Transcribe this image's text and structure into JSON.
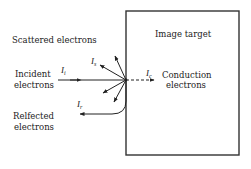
{
  "diagram": {
    "type": "electron-interaction",
    "target_label": "Image target",
    "labels": {
      "scattered": "Scattered electrons",
      "incident_line1": "Incident",
      "incident_line2": "electrons",
      "reflected_line1": "Relfected",
      "reflected_line2": "electrons",
      "conduction_line1": "Conduction",
      "conduction_line2": "electrons"
    },
    "symbols": {
      "incident": {
        "main": "I",
        "sub": "i"
      },
      "scattered": {
        "main": "I",
        "sub": "s"
      },
      "reflected": {
        "main": "I",
        "sub": "r"
      },
      "conduction": {
        "main": "I",
        "sub": "c"
      }
    },
    "colors": {
      "ink": "#222222",
      "background": "#ffffff"
    }
  }
}
